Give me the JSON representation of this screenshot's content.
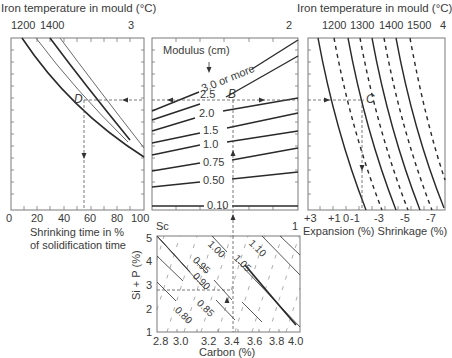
{
  "panels": {
    "p3": {
      "number": "3",
      "top_axis_title": "Iron temperature in mould (°C)",
      "top_ticks": [
        "1200",
        "1400"
      ],
      "point_label": "D",
      "x_ticks": [
        "0",
        "20",
        "40",
        "60",
        "80",
        "100"
      ],
      "x_label_line1": "Shrinking time in %",
      "x_label_line2": "of solidification time"
    },
    "p2": {
      "number": "2",
      "title": "Modulus (cm)",
      "point_label": "B",
      "curve_labels": [
        "3.0 or more",
        "2.5",
        "2.0",
        "1.5",
        "1.0",
        "0.75",
        "0.50",
        "0.10"
      ],
      "bottom_left_label": "Sc",
      "bottom_right_label": "1"
    },
    "p4": {
      "number": "4",
      "top_axis_title": "Iron temperature in mould (°C)",
      "top_ticks": [
        "1200",
        "1300",
        "1400",
        "1500"
      ],
      "point_label": "C",
      "x_ticks": [
        "+3",
        "+1",
        "0",
        "-1",
        "-3",
        "-5",
        "-7"
      ],
      "x_label": "Expansion (%) Shrinkage (%)"
    },
    "p1": {
      "y_label": "Si + P (%)",
      "y_ticks": [
        "5",
        "4",
        "3",
        "2",
        "1"
      ],
      "x_ticks": [
        "2.8",
        "3.0",
        "3.2",
        "3.4",
        "3.6",
        "3.8",
        "4.0"
      ],
      "x_label": "Carbon (%)",
      "sc_labels": [
        "0.80",
        "0.85",
        "0.90",
        "0.95",
        "1.00",
        "1.05",
        "1.10"
      ]
    }
  },
  "colors": {
    "line": "#2a2a2a",
    "thin_line": "#6a6a6a",
    "frame": "#7a7a7a",
    "text": "#3a3a3a"
  }
}
